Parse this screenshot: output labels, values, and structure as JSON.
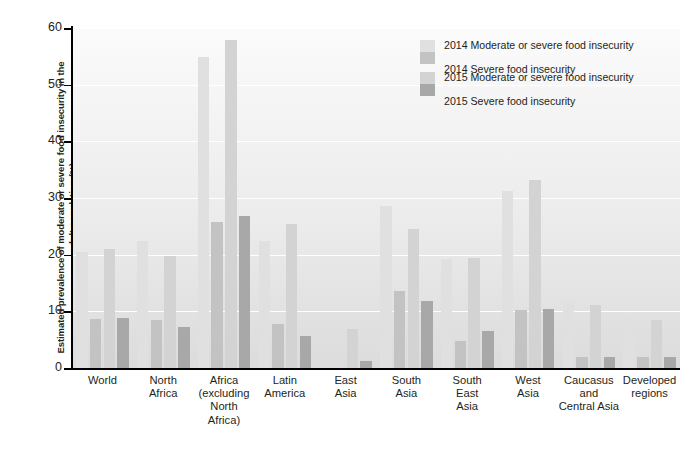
{
  "chart_data": {
    "type": "bar",
    "title": "",
    "xlabel": "",
    "ylabel": "Estimated prevalence of moderate or severe food insecurity in the adult population (%)",
    "ylim": [
      0,
      60
    ],
    "ytick_labels": [
      "0",
      "10",
      "20",
      "30",
      "40",
      "50",
      "60"
    ],
    "yticks": [
      0,
      10,
      20,
      30,
      40,
      50,
      60
    ],
    "grid": true,
    "grid_color": "#ffffff",
    "legend_position": "top-right",
    "categories": [
      "World",
      "North Africa",
      "Africa (excluding North Africa)",
      "Latin America",
      "East Asia",
      "South Asia",
      "South East Asia",
      "West Asia",
      "Caucasus and Central Asia",
      "Developed regions"
    ],
    "series": [
      {
        "name": "2014 Moderate or severe food insecurity",
        "color": "#e0e0e0",
        "values": [
          20.5,
          22.5,
          54.8,
          22.4,
          0,
          28.6,
          19.3,
          31.3,
          11.6,
          9.0
        ]
      },
      {
        "name": "2014 Severe food insecurity",
        "color": "#c3c3c3",
        "values": [
          8.6,
          8.5,
          25.8,
          7.7,
          0,
          13.6,
          4.8,
          10.2,
          2.0,
          2.0
        ]
      },
      {
        "name": "2015 Moderate or severe food insecurity",
        "color": "#d3d3d3",
        "values": [
          21.0,
          19.8,
          57.8,
          25.4,
          6.9,
          24.5,
          19.4,
          33.2,
          11.1,
          8.4
        ]
      },
      {
        "name": "2015 Severe food insecurity",
        "color": "#a8a8a8",
        "values": [
          8.8,
          7.2,
          26.8,
          5.6,
          1.3,
          11.9,
          6.5,
          10.4,
          1.9,
          1.9
        ]
      }
    ]
  },
  "axis": {
    "y_title": "Estimated prevalence of moderate or severe food insecurity in the adult population (%)",
    "y_ticks": [
      "60",
      "50",
      "40",
      "30",
      "20",
      "10",
      "0"
    ]
  },
  "legend": {
    "items": [
      "2014 Moderate or severe food insecurity",
      "2014 Severe food insecurity",
      "2015 Moderate or severe food insecurity",
      "2015 Severe food insecurity"
    ]
  },
  "x_labels": [
    "World",
    "North\nAfrica",
    "Africa\n(excluding\nNorth\nAfrica)",
    "Latin\nAmerica",
    "East\nAsia",
    "South\nAsia",
    "South\nEast\nAsia",
    "West\nAsia",
    "Caucasus\nand\nCentral Asia",
    "Developed\nregions"
  ]
}
